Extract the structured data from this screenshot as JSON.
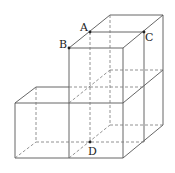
{
  "diagram": {
    "type": "3d-stacked-cubes",
    "colors": {
      "line": "#555555",
      "hidden": "#777777",
      "point": "#222222"
    },
    "points": [
      {
        "label": "A",
        "x": 90,
        "y": 32
      },
      {
        "label": "B",
        "x": 69,
        "y": 48
      },
      {
        "label": "C",
        "x": 144,
        "y": 32
      },
      {
        "label": "D",
        "x": 90,
        "y": 142
      }
    ]
  }
}
